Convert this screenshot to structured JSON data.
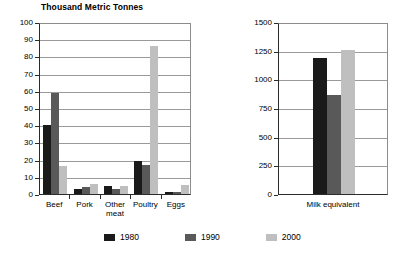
{
  "chart_data": [
    {
      "type": "bar",
      "title": "Thousand Metric Tonnes",
      "xlabel": "",
      "ylabel": "",
      "ylim": [
        0,
        100
      ],
      "yticks": [
        0,
        10,
        20,
        30,
        40,
        50,
        60,
        70,
        80,
        90,
        100
      ],
      "ytick_labels": [
        "0",
        "10",
        "20",
        "30",
        "40",
        "50",
        "60",
        "70",
        "80",
        "90",
        "100"
      ],
      "grid": true,
      "categories": [
        "Beef",
        "Pork",
        "Other meat",
        "Poultry",
        "Eggs"
      ],
      "category_lines": [
        [
          "Beef"
        ],
        [
          "Pork"
        ],
        [
          "Other",
          "meat"
        ],
        [
          "Poultry"
        ],
        [
          "Eggs"
        ]
      ],
      "series": [
        {
          "name": "1980",
          "color": "#1a1a1a",
          "values": [
            40,
            3,
            4.5,
            19,
            1
          ]
        },
        {
          "name": "1990",
          "color": "#595959",
          "values": [
            59,
            4,
            3,
            17,
            1
          ]
        },
        {
          "name": "2000",
          "color": "#bfbfbf",
          "values": [
            16,
            6,
            4.5,
            86,
            5
          ]
        }
      ]
    },
    {
      "type": "bar",
      "title": "",
      "xlabel": "",
      "ylabel": "",
      "ylim": [
        0,
        1500
      ],
      "yticks": [
        0,
        250,
        500,
        750,
        1000,
        1250,
        1500
      ],
      "ytick_labels": [
        "0",
        "250",
        "500",
        "750",
        "1000",
        "1250",
        "1500"
      ],
      "grid": true,
      "categories": [
        "Milk equivalent"
      ],
      "category_lines": [
        [
          "Milk equivalent"
        ]
      ],
      "series": [
        {
          "name": "1980",
          "color": "#1a1a1a",
          "values": [
            1190
          ]
        },
        {
          "name": "1990",
          "color": "#595959",
          "values": [
            860
          ]
        },
        {
          "name": "2000",
          "color": "#bfbfbf",
          "values": [
            1255
          ]
        }
      ]
    }
  ],
  "legend": {
    "position": "bottom",
    "items": [
      {
        "label": "1980",
        "color": "#1a1a1a"
      },
      {
        "label": "1990",
        "color": "#595959"
      },
      {
        "label": "2000",
        "color": "#bfbfbf"
      }
    ]
  }
}
